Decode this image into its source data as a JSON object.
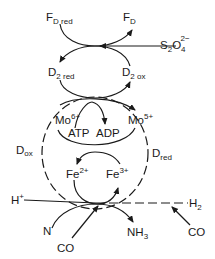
{
  "diagram": {
    "type": "reaction-scheme",
    "top_cycle": {
      "ferredoxin_reduced": {
        "base": "F",
        "sub": "D red"
      },
      "ferredoxin_oxidized": {
        "base": "F",
        "sub": "D"
      },
      "reductant": {
        "base": "S",
        "sub1": "2",
        "mid": "O",
        "sub2": "4",
        "sup": "2−"
      }
    },
    "middle_cycle": {
      "d2_reduced": {
        "base": "D",
        "sub": "2 red"
      },
      "d2_oxidized": {
        "base": "D",
        "sub": "2 ox"
      }
    },
    "molybdenum_cycle": {
      "mo_left": {
        "base": "Mo",
        "sup": "6+"
      },
      "mo_right": {
        "base": "Mo",
        "sup": "5+"
      },
      "atp": "ATP",
      "adp": "ADP"
    },
    "iron_cycle": {
      "fe_left": {
        "base": "Fe",
        "sup": "2+"
      },
      "fe_right": {
        "base": "Fe",
        "sup": "3+"
      }
    },
    "side_labels": {
      "d_ox": {
        "base": "D",
        "sub": "ox"
      },
      "d_red": {
        "base": "D",
        "sub": "red"
      }
    },
    "substrates": {
      "proton": {
        "base": "H",
        "sup": "+"
      },
      "hydrogen": {
        "base": "H",
        "sub": "2"
      },
      "nitrogen": "N",
      "co_left": "CO",
      "ammonia": {
        "base": "NH",
        "sub": "3"
      },
      "co_right": "CO"
    }
  }
}
